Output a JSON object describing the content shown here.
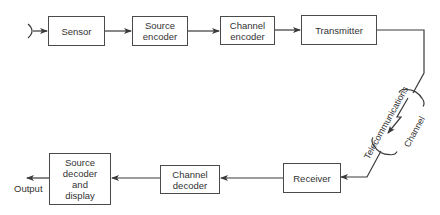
{
  "diagram": {
    "type": "block-diagram",
    "title": "",
    "blocks": [
      {
        "id": "sensor",
        "label": "Sensor"
      },
      {
        "id": "source_encoder",
        "label": "Source\nencoder"
      },
      {
        "id": "channel_encoder",
        "label": "Channel\nencoder"
      },
      {
        "id": "transmitter",
        "label": "Transmitter"
      },
      {
        "id": "receiver",
        "label": "Receiver"
      },
      {
        "id": "channel_decoder",
        "label": "Channel\ndecoder"
      },
      {
        "id": "source_decoder_display",
        "label": "Source\ndecoder\nand\ndisplay"
      }
    ],
    "channel": {
      "label_outer": "Telecommunications",
      "label_inner": "Channel"
    },
    "output_label": "Output",
    "edges": [
      [
        "input",
        "sensor"
      ],
      [
        "sensor",
        "source_encoder"
      ],
      [
        "source_encoder",
        "channel_encoder"
      ],
      [
        "channel_encoder",
        "transmitter"
      ],
      [
        "transmitter",
        "channel"
      ],
      [
        "channel",
        "receiver"
      ],
      [
        "receiver",
        "channel_decoder"
      ],
      [
        "channel_decoder",
        "source_decoder_display"
      ],
      [
        "source_decoder_display",
        "output"
      ]
    ]
  },
  "labels": {
    "sensor": "Sensor",
    "source_encoder_1": "Source",
    "source_encoder_2": "encoder",
    "channel_encoder_1": "Channel",
    "channel_encoder_2": "encoder",
    "transmitter": "Transmitter",
    "receiver": "Receiver",
    "channel_decoder_1": "Channel",
    "channel_decoder_2": "decoder",
    "sdd_1": "Source",
    "sdd_2": "decoder",
    "sdd_3": "and",
    "sdd_4": "display",
    "output": "Output",
    "telecom": "Telecommunications",
    "channel": "Channel"
  }
}
